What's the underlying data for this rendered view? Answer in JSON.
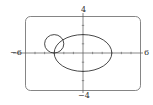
{
  "chart_data": {
    "type": "line",
    "title": "",
    "xlabel": "",
    "ylabel": "",
    "xlim": [
      -6,
      6
    ],
    "ylim": [
      -4,
      4
    ],
    "grid": false,
    "tick_labels": {
      "x_min": "−6",
      "x_max": "6",
      "y_min": "−4",
      "y_max": "4"
    },
    "x_ticks": [
      -5,
      -4,
      -3,
      -2,
      -1,
      1,
      2,
      3,
      4,
      5
    ],
    "y_ticks": [
      -3,
      -2,
      -1,
      1,
      2,
      3
    ],
    "series": [
      {
        "name": "ellipse",
        "equation": "x^2/9 + y^2/4 = 1",
        "center": [
          0,
          0
        ],
        "rx": 3,
        "ry": 2
      },
      {
        "name": "circle",
        "equation": "(x+3)^2 + (y-1)^2 = 1",
        "center": [
          -3,
          1
        ],
        "rx": 1,
        "ry": 1
      }
    ],
    "colors": {
      "curve": "#333333",
      "axis": "#555555",
      "frame": "#666666"
    }
  }
}
